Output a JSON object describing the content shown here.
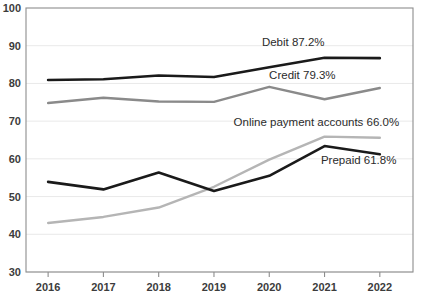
{
  "chart_data": {
    "type": "line",
    "title": "",
    "subtitle": "",
    "xlabel": "",
    "ylabel": "",
    "categories": [
      "2016",
      "2017",
      "2018",
      "2019",
      "2020",
      "2021",
      "2022"
    ],
    "x": [
      2016,
      2017,
      2018,
      2019,
      2020,
      2021,
      2022
    ],
    "xlim": [
      2015.6,
      2022.6
    ],
    "ylim": [
      30,
      100
    ],
    "ytick_labels": [
      "100",
      "90",
      "80",
      "70",
      "60",
      "50",
      "40",
      "30"
    ],
    "yticks": [
      100,
      90,
      80,
      70,
      60,
      50,
      40,
      30
    ],
    "grid": true,
    "grid_axis": "y",
    "legend": "inline-end-labels",
    "series": [
      {
        "name": "Debit",
        "label": "Debit 87.2%",
        "end_value_text": "87.2%",
        "color": "#1a1a1a",
        "width": 2.6,
        "values": [
          80.9,
          81.1,
          82.1,
          81.7,
          84.3,
          86.8,
          86.7
        ]
      },
      {
        "name": "Credit",
        "label": "Credit 79.3%",
        "end_value_text": "79.3%",
        "color": "#8a8a8a",
        "width": 2.4,
        "values": [
          74.8,
          76.2,
          75.2,
          75.1,
          79.1,
          75.8,
          78.8
        ]
      },
      {
        "name": "Online payment accounts",
        "label": "Online payment accounts 66.0%",
        "end_value_text": "66.0%",
        "color": "#b5b5b5",
        "width": 2.4,
        "values": [
          43.0,
          44.6,
          47.1,
          52.6,
          59.8,
          65.9,
          65.6
        ]
      },
      {
        "name": "Prepaid",
        "label": "Prepaid 61.8%",
        "end_value_text": "61.8%",
        "color": "#1a1a1a",
        "width": 2.6,
        "values": [
          53.9,
          51.9,
          56.4,
          51.5,
          55.5,
          63.4,
          61.2
        ]
      }
    ],
    "annotations": [
      {
        "text": "Debit 87.2%",
        "x": 2021.0,
        "y": 89.8,
        "anchor": "end"
      },
      {
        "text": "Credit 79.3%",
        "x": 2021.2,
        "y": 81.3,
        "anchor": "end"
      },
      {
        "text": "Online payment accounts 66.0%",
        "x": 2022.35,
        "y": 68.6,
        "anchor": "end"
      },
      {
        "text": "Prepaid 61.8%",
        "x": 2022.3,
        "y": 58.7,
        "anchor": "end"
      }
    ]
  },
  "colors": {
    "background": "#ffffff",
    "axis": "#8d8d8d",
    "grid": "#e9e9e9",
    "text": "#3c3c3c",
    "dark_series": "#1a1a1a",
    "mid_series": "#8a8a8a",
    "light_series": "#b5b5b5"
  }
}
